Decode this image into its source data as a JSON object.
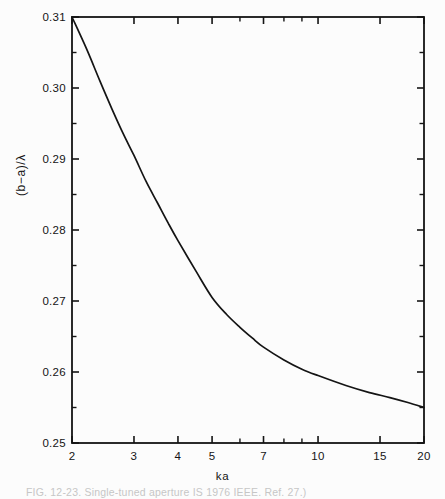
{
  "figure": {
    "background_color": "#fcfcfc",
    "ink_color": "#141414",
    "caption_visible_fragment": "FIG. 12-23.  Single-tuned aperture     IS  1976 IEEE.  Ref. 27.)"
  },
  "chart_data": {
    "type": "line",
    "title": "",
    "subtitle": "",
    "xlabel": "ka",
    "ylabel": "(b−a)/λ",
    "xscale": "log",
    "yscale": "linear",
    "xlim": [
      2,
      20
    ],
    "ylim": [
      0.25,
      0.31
    ],
    "grid": false,
    "legend": null,
    "x_tick_labels": [
      "2",
      "3",
      "4",
      "5",
      "7",
      "10",
      "15",
      "20"
    ],
    "x_tick_values": [
      2,
      3,
      4,
      5,
      7,
      10,
      15,
      20
    ],
    "x_minor_tick_values": [
      6,
      8,
      9
    ],
    "y_tick_labels": [
      "0.25",
      "0.26",
      "0.27",
      "0.28",
      "0.29",
      "0.30",
      "0.31"
    ],
    "y_tick_values": [
      0.25,
      0.26,
      0.27,
      0.28,
      0.29,
      0.3,
      0.31
    ],
    "y_minor_tick_values": [
      0.255,
      0.265,
      0.275,
      0.285,
      0.295,
      0.305
    ],
    "series": [
      {
        "name": "(b-a)/lambda vs ka",
        "x": [
          2.0,
          2.2,
          2.4,
          2.6,
          2.8,
          3.0,
          3.25,
          3.5,
          3.75,
          4.0,
          4.5,
          5.0,
          5.5,
          6.0,
          6.5,
          7.0,
          8.0,
          9.0,
          10.0,
          12.0,
          14.0,
          16.0,
          18.0,
          20.0
        ],
        "y": [
          0.31,
          0.3055,
          0.301,
          0.297,
          0.2935,
          0.2905,
          0.2868,
          0.2838,
          0.281,
          0.2785,
          0.2742,
          0.2705,
          0.2681,
          0.2663,
          0.2648,
          0.2635,
          0.2617,
          0.2604,
          0.2595,
          0.2581,
          0.2571,
          0.2564,
          0.2557,
          0.255
        ]
      }
    ]
  },
  "geometry": {
    "plot_left": 72,
    "plot_right": 424,
    "plot_top": 17,
    "plot_bottom": 443
  }
}
